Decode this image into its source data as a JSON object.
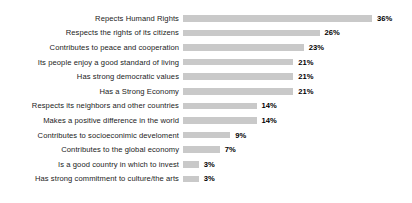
{
  "chart_data": {
    "type": "bar",
    "orientation": "horizontal",
    "title": "",
    "subtitle": "",
    "xlabel": "",
    "ylabel": "",
    "grid": false,
    "legend": false,
    "axis_visible": false,
    "value_suffix": "%",
    "xlim": [
      0,
      36
    ],
    "bar_color": "#c9c9c9",
    "label_color": "#1b1b1b",
    "value_color": "#000000",
    "background_color": "#ffffff",
    "categories": [
      "Repects Humand Rights",
      "Respects the rights of its citizens",
      "Contributes to peace and cooperation",
      "Its people enjoy a good standard of living",
      "Has strong democratic values",
      "Has a Strong Economy",
      "Respects its neighbors and other countries",
      "Makes a positive difference in the world",
      "Contributes to socioeconimic develoment",
      "Contributes to the global economy",
      "Is a good country in which to invest",
      "Has strong commitment to culture/the arts"
    ],
    "values": [
      36,
      26,
      23,
      21,
      21,
      21,
      14,
      14,
      9,
      7,
      3,
      3
    ],
    "value_labels": [
      "36%",
      "26%",
      "23%",
      "21%",
      "21%",
      "21%",
      "14%",
      "14%",
      "9%",
      "7%",
      "3%",
      "3%"
    ]
  }
}
